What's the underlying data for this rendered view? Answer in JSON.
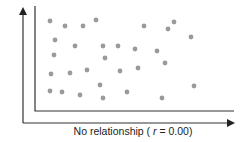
{
  "chart_data": {
    "type": "scatter",
    "title": "",
    "xlabel": "No relationship ( r = 0.00)",
    "xlabel_parts": {
      "prefix": "No relationship ( ",
      "var": "r",
      "suffix": " = 0.00)"
    },
    "ylabel": "",
    "correlation_r": 0.0,
    "grid": false,
    "legend": null,
    "point_color": "#9a9a9a",
    "axis_color": "#333333",
    "points_px": [
      [
        50,
        21
      ],
      [
        65,
        26
      ],
      [
        83,
        26
      ],
      [
        96,
        20
      ],
      [
        144,
        26
      ],
      [
        168,
        29
      ],
      [
        174,
        22
      ],
      [
        191,
        37
      ],
      [
        55,
        40
      ],
      [
        75,
        46
      ],
      [
        103,
        46
      ],
      [
        118,
        46
      ],
      [
        135,
        49
      ],
      [
        157,
        51
      ],
      [
        54,
        55
      ],
      [
        105,
        58
      ],
      [
        165,
        63
      ],
      [
        51,
        74
      ],
      [
        70,
        73
      ],
      [
        87,
        70
      ],
      [
        120,
        71
      ],
      [
        138,
        68
      ],
      [
        50,
        91
      ],
      [
        62,
        92
      ],
      [
        80,
        95
      ],
      [
        100,
        85
      ],
      [
        103,
        98
      ],
      [
        127,
        92
      ],
      [
        162,
        98
      ],
      [
        194,
        86
      ]
    ]
  }
}
